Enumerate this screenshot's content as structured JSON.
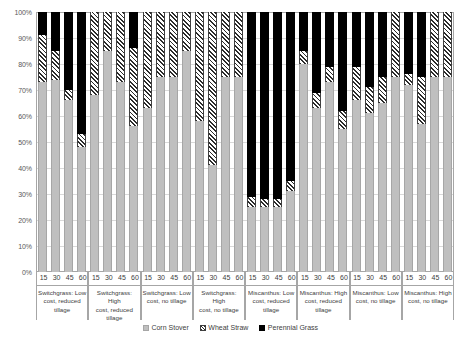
{
  "chart_data": {
    "type": "bar",
    "subtype": "stacked-100-percent",
    "title": "",
    "xlabel": "",
    "ylabel": "",
    "ylim": [
      0,
      100
    ],
    "y_tick_labels": [
      "0%",
      "10%",
      "20%",
      "30%",
      "40%",
      "50%",
      "60%",
      "70%",
      "80%",
      "90%",
      "100%"
    ],
    "y_tick_values": [
      0,
      10,
      20,
      30,
      40,
      50,
      60,
      70,
      80,
      90,
      100
    ],
    "grid": true,
    "legend_position": "bottom",
    "legend": [
      "Corn Stover",
      "Wheat Straw",
      "Perennial Grass"
    ],
    "series": [
      {
        "name": "Corn Stover",
        "color": "#bfbfbf",
        "pattern": "solid-gray",
        "values": [
          73,
          74,
          66,
          48,
          68,
          85,
          73,
          56,
          63,
          75,
          75,
          85,
          58,
          41,
          75,
          75,
          25,
          25,
          25,
          31,
          80,
          63,
          73,
          55,
          66,
          61,
          65,
          75,
          72,
          57,
          75,
          75
        ]
      },
      {
        "name": "Wheat Straw",
        "color": "#ffffff",
        "pattern": "diagonal-hatch",
        "values": [
          18,
          11,
          4,
          5,
          32,
          15,
          27,
          30,
          37,
          25,
          25,
          15,
          42,
          59,
          25,
          25,
          4,
          3,
          3,
          4,
          5,
          6,
          6,
          7,
          13,
          10,
          10,
          25,
          4,
          18,
          25,
          25
        ]
      },
      {
        "name": "Perennial Grass",
        "color": "#000000",
        "pattern": "solid-black",
        "values": [
          9,
          15,
          30,
          47,
          0,
          0,
          0,
          14,
          0,
          0,
          0,
          0,
          0,
          0,
          0,
          0,
          71,
          72,
          72,
          65,
          15,
          31,
          21,
          38,
          21,
          29,
          25,
          0,
          24,
          25,
          0,
          0
        ]
      }
    ],
    "groups": [
      {
        "label_lines": [
          "Switchgrass: Low",
          "cost, reduced",
          "tillage"
        ],
        "categories": [
          "15",
          "30",
          "45",
          "60"
        ]
      },
      {
        "label_lines": [
          "Switchgrass: High",
          "cost, reduced",
          "tillage"
        ],
        "categories": [
          "15",
          "30",
          "45",
          "60"
        ]
      },
      {
        "label_lines": [
          "Switchgrass: Low",
          "cost, no tillage",
          ""
        ],
        "categories": [
          "15",
          "30",
          "45",
          "60"
        ]
      },
      {
        "label_lines": [
          "Switchgrass: High",
          "cost, no tillage",
          ""
        ],
        "categories": [
          "15",
          "30",
          "45",
          "60"
        ]
      },
      {
        "label_lines": [
          "Miscanthus: Low",
          "cost, reduced",
          "tillage"
        ],
        "categories": [
          "15",
          "30",
          "45",
          "60"
        ]
      },
      {
        "label_lines": [
          "Miscanthus: High",
          "cost, reduced",
          "tillage"
        ],
        "categories": [
          "15",
          "30",
          "45",
          "60"
        ]
      },
      {
        "label_lines": [
          "Miscanthus: Low",
          "cost, no tillage",
          ""
        ],
        "categories": [
          "15",
          "30",
          "45",
          "60"
        ]
      },
      {
        "label_lines": [
          "Miscanthus: High",
          "cost, no tillage",
          ""
        ],
        "categories": [
          "15",
          "30",
          "45",
          "60"
        ]
      }
    ]
  },
  "colors": {
    "corn_stover": "#bfbfbf",
    "wheat_straw": "#ffffff",
    "perennial_grass": "#000000",
    "axis": "#a6a6a6",
    "gridline": "#d9d9d9",
    "text": "#404040"
  }
}
